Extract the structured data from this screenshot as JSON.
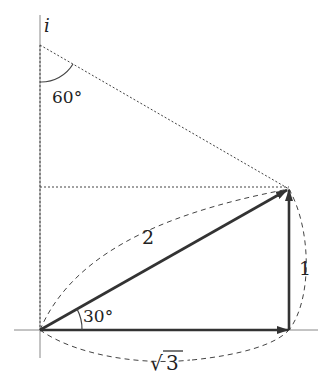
{
  "diagram": {
    "axis_label_imag": "i",
    "angle_top_label": "60°",
    "angle_bottom_label": "30°",
    "hypotenuse_label": "2",
    "vertical_side_label": "1",
    "horizontal_side_label_radical": "√",
    "horizontal_side_label_value": "3",
    "colors": {
      "stroke": "#333333",
      "axis": "#777777",
      "background": "#ffffff"
    }
  }
}
